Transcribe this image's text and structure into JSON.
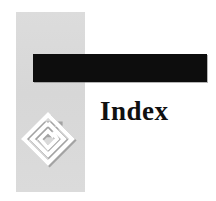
{
  "page": {
    "background_color": "#ffffff",
    "width": 216,
    "height": 201
  },
  "decor": {
    "gray_column": {
      "name": "gray-vertical-band",
      "color": "#d9d9d9"
    },
    "black_bar": {
      "name": "black-horizontal-banner",
      "color": "#0d0d0d"
    }
  },
  "title": {
    "text": "Index",
    "color": "#101010"
  },
  "logo": {
    "icon_name": "spiral-diamond-logo",
    "stroke_color": "#ffffff",
    "shadow_color": "#8f8f8f"
  }
}
